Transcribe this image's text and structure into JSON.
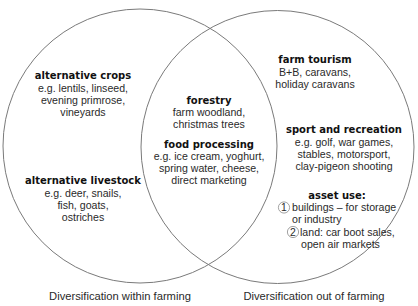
{
  "diagram": {
    "type": "venn",
    "colors": {
      "stroke": "#7a7a7a",
      "text": "#2a2a2a",
      "heading": "#111111",
      "background": "#ffffff"
    },
    "sets": [
      {
        "name": "Diversification within farming"
      },
      {
        "name": "Diversification out of farming"
      }
    ],
    "left_only": [
      {
        "heading": "alternative crops",
        "lines": [
          "e.g. lentils, linseed,",
          "evening primrose,",
          "vineyards"
        ]
      },
      {
        "heading": "alternative livestock",
        "lines": [
          "e.g. deer, snails,",
          "fish, goats,",
          "ostriches"
        ]
      }
    ],
    "overlap": [
      {
        "heading": "forestry",
        "lines": [
          "farm woodland,",
          "christmas trees"
        ]
      },
      {
        "heading": "food processing",
        "lines": [
          "e.g. ice cream, yoghurt,",
          "spring water, cheese,",
          "direct marketing"
        ]
      }
    ],
    "right_only": [
      {
        "heading": "farm tourism",
        "lines": [
          "B+B, caravans,",
          "holiday caravans"
        ]
      },
      {
        "heading": "sport and recreation",
        "lines": [
          "e.g. golf, war games,",
          "stables, motorsport,",
          "clay-pigeon shooting"
        ]
      },
      {
        "heading": "asset use:",
        "items": [
          {
            "number": "1",
            "lines": [
              "buildings – for storage",
              "or industry"
            ]
          },
          {
            "number": "2",
            "lines": [
              "land: car boot sales,",
              "open air markets"
            ]
          }
        ]
      }
    ]
  }
}
